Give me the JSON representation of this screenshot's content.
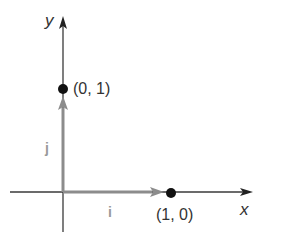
{
  "diagram": {
    "title": "",
    "axes": {
      "x_label": "x",
      "y_label": "y"
    },
    "points": [
      {
        "label": "(0, 1)",
        "x": 0,
        "y": 1
      },
      {
        "label": "(1, 0)",
        "x": 1,
        "y": 0
      }
    ],
    "vectors": [
      {
        "label": "i",
        "from": [
          0,
          0
        ],
        "to": [
          1,
          0
        ]
      },
      {
        "label": "j",
        "from": [
          0,
          0
        ],
        "to": [
          0,
          1
        ]
      }
    ],
    "colors": {
      "axis": "#333333",
      "vector": "#8c8c8c",
      "point": "#111111",
      "vector_label": "#9a9a9a"
    }
  }
}
